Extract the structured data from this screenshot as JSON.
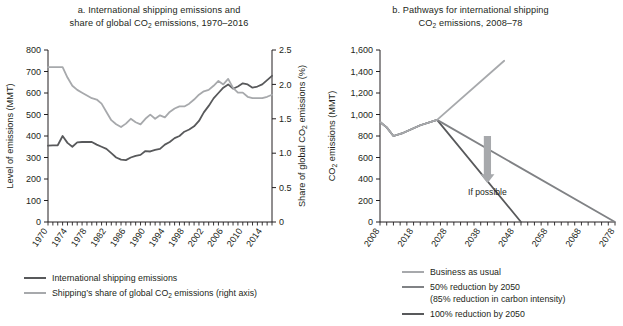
{
  "panel_a": {
    "title_line1": "a. International shipping emissions and",
    "title_line2_pre": "share of global CO",
    "title_line2_sub": "2",
    "title_line2_post": " emissions, 1970–2016",
    "y_left_label": "Level of emissions (MMT)",
    "y_right_label_pre": "Share of global CO",
    "y_right_label_sub": "2",
    "y_right_label_post": " emissions (%)",
    "legend": [
      {
        "label": "International shipping emissions",
        "color": "#58595b"
      },
      {
        "label_pre": "Shipping’s share of global CO",
        "label_sub": "2",
        "label_post": " emissions (right axis)",
        "color": "#a7a9ac"
      }
    ]
  },
  "panel_b": {
    "title_line1": "b. Pathways for international shipping",
    "title_line2_pre": "CO",
    "title_line2_sub": "2",
    "title_line2_post": " emissions, 2008–78",
    "y_label_pre": "CO",
    "y_label_sub": "2",
    "y_label_post": " emissions (MMT)",
    "annotation": "If possible",
    "legend": [
      {
        "label": "Business as usual",
        "color": "#a7a9ac"
      },
      {
        "label": "50% reduction by 2050",
        "label2": "(85% reduction in carbon intensity)",
        "color": "#808285"
      },
      {
        "label": "100% reduction by 2050",
        "color": "#58595b"
      }
    ]
  },
  "chart_data": [
    {
      "type": "line",
      "title": "a. International shipping emissions and share of global CO2 emissions, 1970–2016",
      "xlabel": "",
      "ylabel": "Level of emissions (MMT)",
      "y2label": "Share of global CO2 emissions (%)",
      "xlim": [
        1970,
        2016
      ],
      "ylim": [
        0,
        800
      ],
      "y2lim": [
        0,
        2.5
      ],
      "yticks": [
        0,
        100,
        200,
        300,
        400,
        500,
        600,
        700,
        800
      ],
      "y2ticks": [
        0,
        0.5,
        1.0,
        1.5,
        2.0,
        2.5
      ],
      "xticks": [
        1970,
        1974,
        1978,
        1982,
        1986,
        1990,
        1994,
        1998,
        2002,
        2006,
        2010,
        2014
      ],
      "xtick_labels": [
        "1970",
        "1974",
        "1978",
        "1982",
        "1986",
        "1990",
        "1994",
        "1998",
        "2002",
        "2006",
        "2010",
        "2014"
      ],
      "grid": false,
      "legend_position": "below",
      "x": [
        1970,
        1971,
        1972,
        1973,
        1974,
        1975,
        1976,
        1977,
        1978,
        1979,
        1980,
        1981,
        1982,
        1983,
        1984,
        1985,
        1986,
        1987,
        1988,
        1989,
        1990,
        1991,
        1992,
        1993,
        1994,
        1995,
        1996,
        1997,
        1998,
        1999,
        2000,
        2001,
        2002,
        2003,
        2004,
        2005,
        2006,
        2007,
        2008,
        2009,
        2010,
        2011,
        2012,
        2013,
        2014,
        2015,
        2016
      ],
      "series": [
        {
          "name": "International shipping emissions",
          "axis": "left",
          "color": "#58595b",
          "units": "MMT",
          "values": [
            355,
            356,
            357,
            400,
            368,
            350,
            370,
            372,
            373,
            372,
            360,
            350,
            340,
            320,
            300,
            290,
            288,
            300,
            308,
            312,
            330,
            328,
            335,
            340,
            360,
            372,
            390,
            400,
            420,
            430,
            445,
            470,
            510,
            540,
            575,
            600,
            625,
            640,
            620,
            630,
            645,
            640,
            625,
            630,
            640,
            660,
            680
          ]
        },
        {
          "name": "Shipping's share of global CO2 emissions (right axis)",
          "axis": "right",
          "color": "#a7a9ac",
          "units": "%",
          "values": [
            2.25,
            2.25,
            2.25,
            2.25,
            2.1,
            1.98,
            1.92,
            1.88,
            1.84,
            1.8,
            1.78,
            1.72,
            1.6,
            1.48,
            1.42,
            1.38,
            1.43,
            1.5,
            1.45,
            1.42,
            1.5,
            1.56,
            1.5,
            1.55,
            1.52,
            1.6,
            1.65,
            1.68,
            1.68,
            1.72,
            1.78,
            1.85,
            1.9,
            1.92,
            1.98,
            2.05,
            2.0,
            2.08,
            1.95,
            1.88,
            1.88,
            1.82,
            1.8,
            1.8,
            1.8,
            1.82,
            1.85
          ]
        }
      ]
    },
    {
      "type": "line",
      "title": "b. Pathways for international shipping CO2 emissions, 2008–78",
      "xlabel": "",
      "ylabel": "CO2 emissions (MMT)",
      "xlim": [
        2008,
        2078
      ],
      "ylim": [
        0,
        1600
      ],
      "yticks": [
        0,
        200,
        400,
        600,
        800,
        1000,
        1200,
        1400,
        1600
      ],
      "ytick_labels": [
        "0",
        "200",
        "400",
        "600",
        "800",
        "1,000",
        "1,200",
        "1,400",
        "1,600"
      ],
      "xticks": [
        2008,
        2018,
        2028,
        2038,
        2048,
        2058,
        2068,
        2078
      ],
      "xtick_labels": [
        "2008",
        "2018",
        "2028",
        "2038",
        "2048",
        "2058",
        "2068",
        "2078"
      ],
      "grid": false,
      "legend_position": "below",
      "annotations": [
        {
          "text": "If possible",
          "x": 2040,
          "y": 300,
          "arrow": "down"
        }
      ],
      "series": [
        {
          "name": "Business as usual",
          "color": "#a7a9ac",
          "x": [
            2008,
            2010,
            2012,
            2015,
            2020,
            2025,
            2045
          ],
          "values": [
            930,
            880,
            800,
            830,
            900,
            950,
            1500
          ]
        },
        {
          "name": "50% reduction by 2050",
          "color": "#808285",
          "x": [
            2008,
            2010,
            2012,
            2015,
            2020,
            2025,
            2078
          ],
          "values": [
            930,
            880,
            800,
            830,
            900,
            950,
            0
          ]
        },
        {
          "name": "100% reduction by 2050",
          "color": "#58595b",
          "x": [
            2008,
            2010,
            2012,
            2015,
            2020,
            2025,
            2050
          ],
          "values": [
            930,
            880,
            800,
            830,
            900,
            950,
            0
          ]
        }
      ]
    }
  ]
}
